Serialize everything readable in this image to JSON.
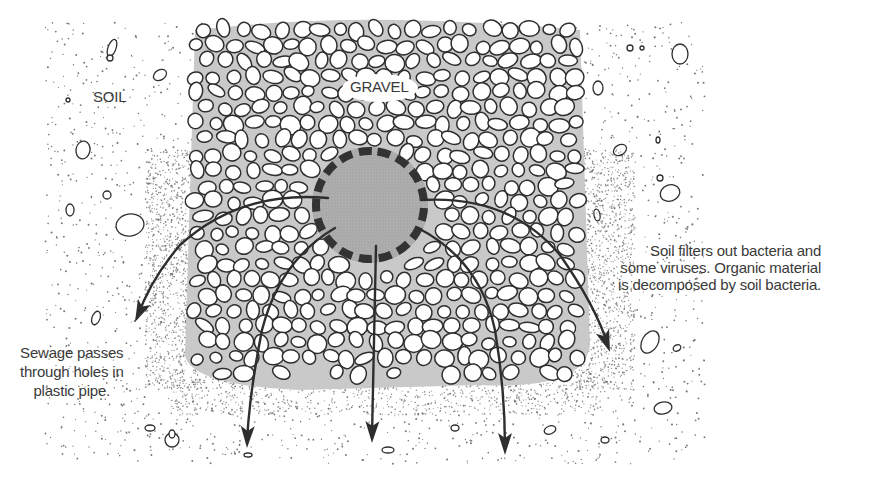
{
  "figure": {
    "labels": {
      "soil": "SOIL",
      "gravel": "GRAVEL",
      "left_caption": [
        "Sewage passes",
        "through holes in",
        "plastic pipe."
      ],
      "right_caption": [
        "Soil filters out bacteria and",
        "some viruses.  Organic material",
        "is decomposed by soil bacteria."
      ]
    },
    "components": [
      {
        "name": "soil",
        "description": "stippled soil region surrounding the trench"
      },
      {
        "name": "gravel",
        "description": "packed gravel bed around the pipe"
      },
      {
        "name": "perforated-pipe",
        "description": "plastic pipe with dashed perforations"
      },
      {
        "name": "flow-arrows",
        "count": 5,
        "description": "sewage flowing outward and downward through soil"
      }
    ],
    "colors": {
      "line": "#2e2e2e",
      "pipe_fill": "#a9a9a9",
      "pipe_holes": "#333333",
      "gravel_gaps": "#c9c9c9",
      "stipple": "#555555",
      "text": "#3a3a3a"
    }
  }
}
